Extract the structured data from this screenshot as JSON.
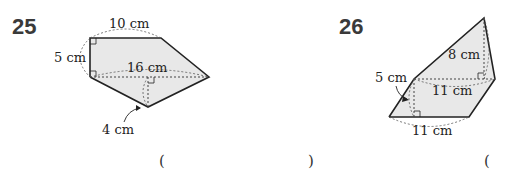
{
  "problems": [
    {
      "number": "25",
      "shape": "pentagon",
      "labels": {
        "top": "10 cm",
        "left": "5 cm",
        "diagonal": "16 cm",
        "height": "4 cm"
      },
      "answer_open": "(",
      "answer_close": ")"
    },
    {
      "number": "26",
      "shape": "quadrilateral",
      "labels": {
        "upper_height": "8 cm",
        "lower_height": "5 cm",
        "diagonal": "11 cm",
        "bottom": "11 cm"
      },
      "answer_open": "("
    }
  ],
  "colors": {
    "fill": "#e8e8e8",
    "stroke": "#222222",
    "number": "#3a3a3a"
  }
}
